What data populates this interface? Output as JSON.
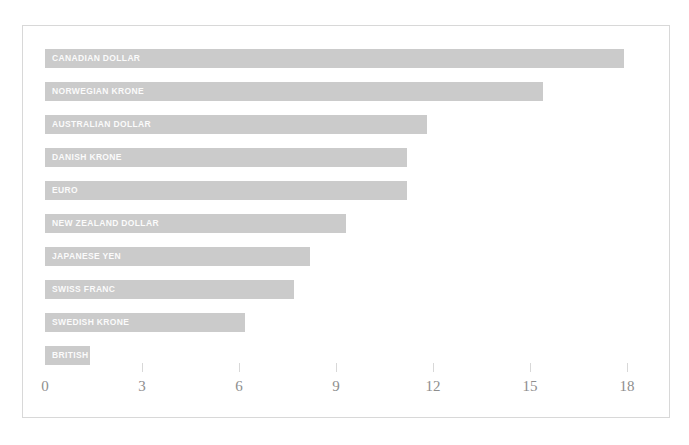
{
  "chart_data": {
    "type": "bar",
    "orientation": "horizontal",
    "title": "",
    "subtitle": "",
    "xlabel": "",
    "ylabel": "",
    "xlim": [
      0,
      19.3
    ],
    "xticks": [
      0,
      3,
      6,
      9,
      12,
      15,
      18
    ],
    "xtick_labels": [
      "0",
      "3",
      "6",
      "9",
      "12",
      "15",
      "18"
    ],
    "grid": false,
    "legend": null,
    "bar_color": "#cbcbcb",
    "label_color": "#ffffff",
    "axis_color": "#8e8e8e",
    "frame_color": "#d8d8d8",
    "categories": [
      "CANADIAN DOLLAR",
      "NORWEGIAN KRONE",
      "AUSTRALIAN DOLLAR",
      "DANISH KRONE",
      "EURO",
      "NEW ZEALAND DOLLAR",
      "JAPANESE YEN",
      "SWISS FRANC",
      "SWEDISH KRONE",
      "BRITISH"
    ],
    "values": [
      17.9,
      15.4,
      11.8,
      11.2,
      11.2,
      9.3,
      8.2,
      7.7,
      6.2,
      1.4
    ]
  }
}
